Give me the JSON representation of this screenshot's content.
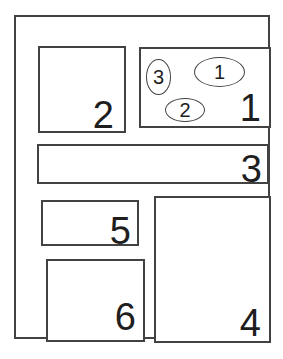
{
  "figure": {
    "background_color": "#ffffff",
    "line_color": "#424242",
    "text_color": "#1e1e1e",
    "regions": [
      {
        "label": "1"
      },
      {
        "label": "2"
      },
      {
        "label": "3"
      },
      {
        "label": "4"
      },
      {
        "label": "5"
      },
      {
        "label": "6"
      }
    ],
    "ovals": [
      {
        "label": "1"
      },
      {
        "label": "2"
      },
      {
        "label": "3"
      }
    ]
  }
}
